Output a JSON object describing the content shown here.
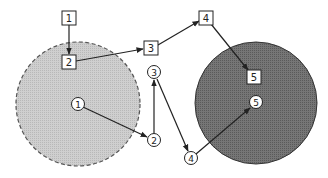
{
  "diagram": {
    "regions": [
      {
        "id": "left-region",
        "cx": 78,
        "cy": 104,
        "r": 62,
        "fill": "#c9c9c9",
        "stroke": "#555555",
        "dashed": true
      },
      {
        "id": "right-region",
        "cx": 256,
        "cy": 103,
        "r": 61,
        "fill": "#6e6e6e",
        "stroke": "#333333",
        "dashed": false
      }
    ],
    "square_nodes": [
      {
        "label": "1",
        "x": 69,
        "y": 18
      },
      {
        "label": "2",
        "x": 69,
        "y": 62
      },
      {
        "label": "3",
        "x": 151,
        "y": 48
      },
      {
        "label": "4",
        "x": 206,
        "y": 18
      },
      {
        "label": "5",
        "x": 254,
        "y": 77
      }
    ],
    "circle_nodes": [
      {
        "label": "1",
        "x": 78,
        "y": 104
      },
      {
        "label": "2",
        "x": 154,
        "y": 140
      },
      {
        "label": "3",
        "x": 154,
        "y": 72
      },
      {
        "label": "4",
        "x": 191,
        "y": 158
      },
      {
        "label": "5",
        "x": 256,
        "y": 102
      }
    ],
    "square_path": [
      {
        "from": "1",
        "to": "2"
      },
      {
        "from": "2",
        "to": "3"
      },
      {
        "from": "3",
        "to": "4"
      },
      {
        "from": "4",
        "to": "5"
      }
    ],
    "circle_path": [
      {
        "from": "1",
        "to": "2"
      },
      {
        "from": "2",
        "to": "3"
      },
      {
        "from": "3",
        "to": "4"
      },
      {
        "from": "4",
        "to": "5"
      }
    ],
    "colors": {
      "line": "#222222",
      "node_fill": "#ffffff",
      "node_stroke": "#222222"
    }
  }
}
